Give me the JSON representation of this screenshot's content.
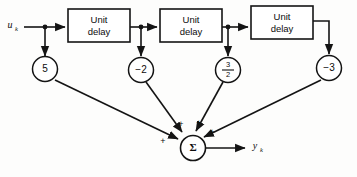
{
  "diagram": {
    "background_color": "#fdfdfc",
    "line_color": "#141414",
    "input": {
      "label_base": "u",
      "label_sub": "k"
    },
    "output": {
      "label_base": "y",
      "label_sub": "k"
    },
    "delay_blocks": [
      {
        "line1": "Unit",
        "line2": "delay"
      },
      {
        "line1": "Unit",
        "line2": "delay"
      },
      {
        "line1": "Unit",
        "line2": "delay"
      }
    ],
    "gains": [
      {
        "value": "5",
        "is_fraction": false,
        "numerator": "",
        "denominator": ""
      },
      {
        "value": "−2",
        "is_fraction": false,
        "numerator": "",
        "denominator": ""
      },
      {
        "value": "",
        "is_fraction": true,
        "numerator": "3",
        "denominator": "2"
      },
      {
        "value": "−3",
        "is_fraction": false,
        "numerator": "",
        "denominator": ""
      }
    ],
    "summer": {
      "symbol": "Σ",
      "signs": [
        "+",
        "+",
        "+",
        "+"
      ]
    }
  }
}
